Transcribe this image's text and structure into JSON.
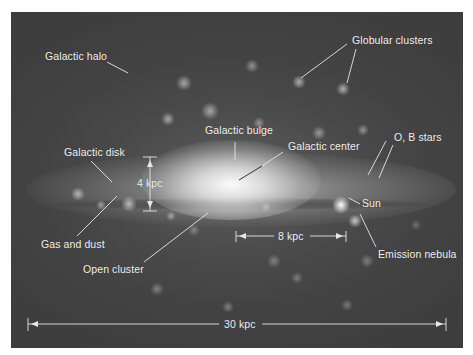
{
  "figure": {
    "background": "#444444",
    "frame_color": "#3f3f3f",
    "label_color": "#f2f2f2"
  },
  "labels": {
    "galactic_halo": "Galactic halo",
    "globular_clusters": "Globular clusters",
    "galactic_bulge": "Galactic bulge",
    "galactic_center": "Galactic center",
    "ob_stars": "O, B stars",
    "galactic_disk": "Galactic disk",
    "disk_thickness": "4 kpc",
    "sun": "Sun",
    "gas_and_dust": "Gas and dust",
    "open_cluster": "Open cluster",
    "sun_distance": "8 kpc",
    "emission_nebula": "Emission nebula",
    "galaxy_diameter": "30 kpc"
  },
  "scale_bars": [
    {
      "name": "disk-thickness",
      "value": "4 kpc",
      "orientation": "vertical"
    },
    {
      "name": "sun-distance",
      "value": "8 kpc",
      "orientation": "horizontal"
    },
    {
      "name": "galaxy-diameter",
      "value": "30 kpc",
      "orientation": "horizontal"
    }
  ]
}
